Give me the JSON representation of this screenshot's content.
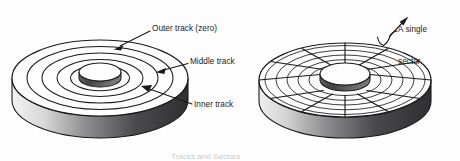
{
  "figure": {
    "background_color": "#fefefe",
    "ink_color": "#1a1a1a",
    "shade_color": "#58585a",
    "shade_dark_color": "#3a3a3c",
    "caption": "Tracks and Sectors"
  },
  "labels": {
    "outer_track": "Outer track (zero)",
    "middle_track": "Middle track",
    "inner_track": "Inner track",
    "single_sector_line1": "A single",
    "single_sector_line2": "sector"
  },
  "left_disk": {
    "name": "tracks-disk",
    "center_x": 100,
    "center_y": 78,
    "radius_x": 88,
    "radius_y": 38,
    "thickness": 22,
    "hole_radius_x": 21,
    "hole_radius_y": 9,
    "track_count": 4,
    "track_radii_x": [
      88,
      73,
      58,
      43,
      28
    ],
    "track_radii_y": [
      38,
      31.5,
      25,
      18.5,
      12
    ]
  },
  "right_disk": {
    "name": "sectors-disk",
    "center_x": 345,
    "center_y": 80,
    "radius_x": 86,
    "radius_y": 37,
    "thickness": 21,
    "hole_radius_x": 25,
    "hole_radius_y": 11,
    "sector_count": 12,
    "track_count": 5,
    "track_radii_x": [
      80,
      69,
      58,
      47,
      36
    ],
    "track_radii_y": [
      34.5,
      29.8,
      25,
      20.3,
      15.5
    ]
  },
  "annotations": {
    "outer_arrow": {
      "name": "outer-track-arrow",
      "from_x": 150,
      "from_y": 30,
      "to_x": 117,
      "to_y": 48
    },
    "middle_arrow": {
      "name": "middle-track-arrow",
      "from_x": 188,
      "from_y": 63,
      "to_x": 158,
      "to_y": 72
    },
    "inner_arrow": {
      "name": "inner-track-arrow",
      "from_x": 192,
      "from_y": 105,
      "to_x": 142,
      "to_y": 86
    },
    "sector_arrow": {
      "name": "single-sector-arrow",
      "from_x": 383,
      "from_y": 45,
      "to_x": 402,
      "to_y": 24
    }
  }
}
